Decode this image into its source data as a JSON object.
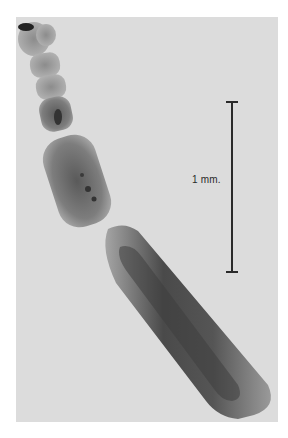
{
  "figure": {
    "background_color": "#dcdcdc",
    "specimen_color": "#8a8a8a",
    "scale_bar": {
      "label": "1 mm.",
      "orientation": "vertical",
      "color": "#2a2a2a"
    }
  }
}
